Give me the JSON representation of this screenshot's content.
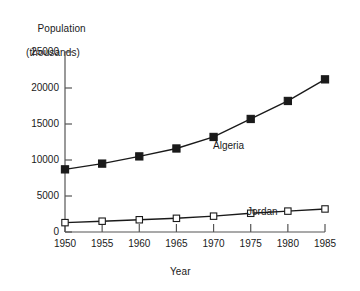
{
  "chart_data": {
    "type": "line",
    "title": "",
    "ylabel": "Population\n(thousands)",
    "ylabel_line1": "Population",
    "ylabel_line2": "(thousands)",
    "xlabel": "Year",
    "x": [
      1950,
      1955,
      1960,
      1965,
      1970,
      1975,
      1980,
      1985
    ],
    "xtick_labels": [
      "1950",
      "1955",
      "1960",
      "1965",
      "1970",
      "1975",
      "1980",
      "1985"
    ],
    "ytick_labels": [
      "0",
      "5000",
      "10000",
      "15000",
      "20000",
      "25000"
    ],
    "ytick_values": [
      0,
      5000,
      10000,
      15000,
      20000,
      25000
    ],
    "xlim": [
      1950,
      1985
    ],
    "ylim": [
      0,
      25000
    ],
    "grid": false,
    "legend_position": "inline-annotation",
    "series": [
      {
        "name": "Algeria",
        "marker": "filled-square",
        "color": "#1a1a1a",
        "values": [
          8700,
          9500,
          10500,
          11600,
          13200,
          15700,
          18200,
          21200
        ]
      },
      {
        "name": "Jordan",
        "marker": "open-square",
        "color": "#1a1a1a",
        "values": [
          1300,
          1500,
          1700,
          1900,
          2200,
          2600,
          2900,
          3200
        ]
      }
    ]
  },
  "colors": {
    "axis": "#555555",
    "line": "#1a1a1a",
    "text": "#1a1a1a",
    "background": "#ffffff"
  }
}
